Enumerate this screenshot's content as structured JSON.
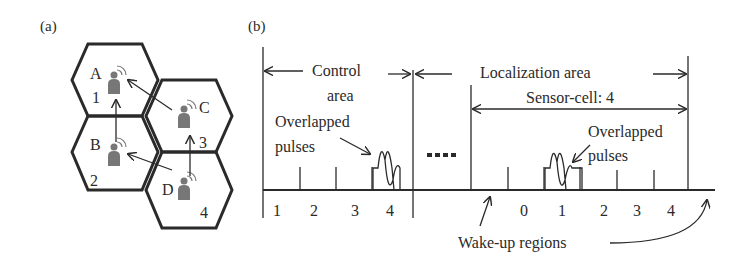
{
  "panel_a": {
    "label": "(a)",
    "cells": [
      {
        "node": "A",
        "number": "1"
      },
      {
        "node": "B",
        "number": "2"
      },
      {
        "node": "C",
        "number": "3"
      },
      {
        "node": "D",
        "number": "4"
      }
    ]
  },
  "panel_b": {
    "label": "(b)",
    "control_area_line1": "Control",
    "control_area_line2": "area",
    "localization_area": "Localization area",
    "sensor_cell": "Sensor-cell: 4",
    "overlapped_left_line1": "Overlapped",
    "overlapped_left_line2": "pulses",
    "overlapped_right_line1": "Overlapped",
    "overlapped_right_line2": "pulses",
    "ellipsis": "▪▪▪▪",
    "control_slots": [
      "1",
      "2",
      "3",
      "4"
    ],
    "localization_slots": [
      "0",
      "1",
      "2",
      "3",
      "4"
    ],
    "wakeup_label": "Wake-up regions"
  }
}
